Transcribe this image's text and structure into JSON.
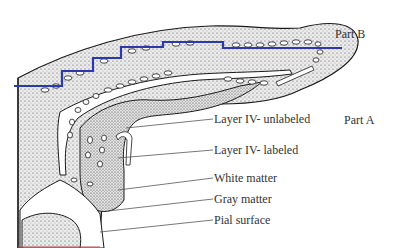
{
  "diagram": {
    "parts": [
      {
        "id": "part-b",
        "label": "Part B",
        "x": 335,
        "y": 27
      },
      {
        "id": "part-a",
        "label": "Part A",
        "x": 344,
        "y": 113
      }
    ],
    "callouts": [
      {
        "id": "layer-iv-unlabeled",
        "label": "Layer IV- unlabeled",
        "x": 214,
        "y": 112,
        "line": [
          126,
          128,
          213,
          119
        ]
      },
      {
        "id": "layer-iv-labeled",
        "label": "Layer IV- labeled",
        "x": 214,
        "y": 143,
        "line": [
          118,
          158,
          213,
          150
        ]
      },
      {
        "id": "white-matter",
        "label": "White matter",
        "x": 214,
        "y": 171,
        "line": [
          118,
          190,
          213,
          178
        ]
      },
      {
        "id": "gray-matter",
        "label": "Gray matter",
        "x": 214,
        "y": 192,
        "line": [
          108,
          211,
          213,
          199
        ]
      },
      {
        "id": "pial-surface",
        "label": "Pial surface",
        "x": 214,
        "y": 213,
        "line": [
          100,
          232,
          213,
          220
        ]
      }
    ],
    "boundary_line": {
      "color": "#2a3aa8",
      "points": "14,86 62,86 62,71 93,71 93,58 121,58 121,47 163,47 163,42 223,42 223,48 342,48"
    },
    "colors": {
      "ink": "#1a1a1a",
      "stipple_fill": "#d6d6d6",
      "label_text": "#333333",
      "callout_line": "#555555",
      "boundary": "#2a3aa8"
    }
  }
}
